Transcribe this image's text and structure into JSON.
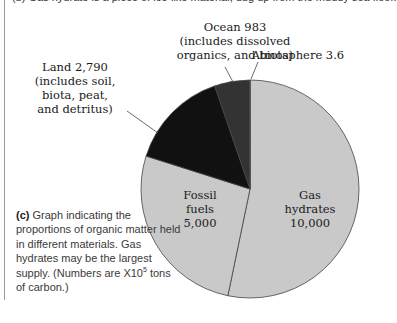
{
  "header": {
    "cropped_text": "(b) Gas hydrate is a piece of ice-like material, dug up from the muddy sea floor."
  },
  "caption": {
    "label": "(c)",
    "text_before_exp": "Graph indicating the proportions of organic matter held in different materials. Gas hydrates may be the largest supply. (Numbers are X10",
    "exponent": "5",
    "text_after_exp": " tons of carbon.)"
  },
  "labels": {
    "ocean": [
      "Ocean  983",
      "(includes dissolved",
      "organics, and biota)"
    ],
    "atmosphere": [
      "Atmosphere  3.6"
    ],
    "land": [
      "Land  2,790",
      "(includes soil,",
      "biota, peat,",
      "and detritus)"
    ],
    "fossil": [
      "Fossil",
      "fuels",
      "5,000"
    ],
    "gas": [
      "Gas",
      "hydrates",
      "10,000"
    ]
  },
  "colors": {
    "gas_hydrates": "#c9c9c9",
    "fossil_fuels": "#c9c9c9",
    "land": "#111111",
    "ocean": "#333333",
    "atmosphere": "#888888",
    "outline": "#444444"
  },
  "chart_data": {
    "type": "pie",
    "title": "",
    "units": "x10^5 tons of carbon",
    "categories": [
      "Gas hydrates",
      "Fossil fuels",
      "Land",
      "Ocean",
      "Atmosphere"
    ],
    "values": [
      10000,
      5000,
      2790,
      983,
      3.6
    ],
    "notes": {
      "Land": "includes soil, biota, peat, and detritus",
      "Ocean": "includes dissolved organics, and biota"
    },
    "start_angle": "top (12 o'clock), clockwise",
    "legend": "none (direct labels)"
  }
}
